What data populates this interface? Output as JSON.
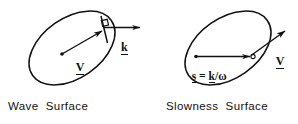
{
  "figure": {
    "title": "",
    "background_color": "#ffffff",
    "stroke_color": "#111111",
    "panels": [
      {
        "id": "wave-surface",
        "caption": "Wave  Surface",
        "shape": "ellipse",
        "ellipse": {
          "cx": 72,
          "cy": 48,
          "rx": 48,
          "ry": 30,
          "rotation_deg": -35
        },
        "center_dot": {
          "x": 62,
          "y": 54
        },
        "vectors": [
          {
            "name": "V",
            "label": "V",
            "underlined": true,
            "from": {
              "x": 62,
              "y": 54
            },
            "to": {
              "x": 103,
              "y": 31
            },
            "label_pos": {
              "x": 71,
              "y": 52
            },
            "description": "ray velocity vector from center to wave surface"
          },
          {
            "name": "k",
            "label": "k",
            "underlined": true,
            "from": {
              "x": 104,
              "y": 28
            },
            "to": {
              "x": 140,
              "y": 28
            },
            "label_pos": {
              "x": 116,
              "y": 31
            },
            "description": "wave normal vector perpendicular to the tangent plane"
          }
        ],
        "tangent_line": {
          "x1": 101,
          "y1": 17,
          "x2": 107,
          "y2": 42
        },
        "right_angle_marker": {
          "x": 101,
          "y": 21,
          "size": 6
        }
      },
      {
        "id": "slowness-surface",
        "caption": "Slowness  Surface",
        "shape": "ellipse",
        "ellipse": {
          "cx": 228,
          "cy": 48,
          "rx": 48,
          "ry": 30,
          "rotation_deg": -35
        },
        "center_dot": {
          "x": 196,
          "y": 57
        },
        "open_point": {
          "x": 252,
          "y": 57
        },
        "vectors": [
          {
            "name": "s",
            "label": "s = k/ω",
            "underlined_terms": [
              "s",
              "k"
            ],
            "from": {
              "x": 196,
              "y": 57
            },
            "to": {
              "x": 250,
              "y": 57
            },
            "label_pos": {
              "x": 194,
              "y": 60
            },
            "description": "slowness vector equals wave vector divided by angular frequency"
          },
          {
            "name": "V",
            "label": "V",
            "underlined": true,
            "from": {
              "x": 251,
              "y": 56
            },
            "to": {
              "x": 285,
              "y": 32
            },
            "label_pos": {
              "x": 272,
              "y": 45
            },
            "description": "ray velocity vector normal to the slowness surface"
          }
        ]
      }
    ]
  }
}
